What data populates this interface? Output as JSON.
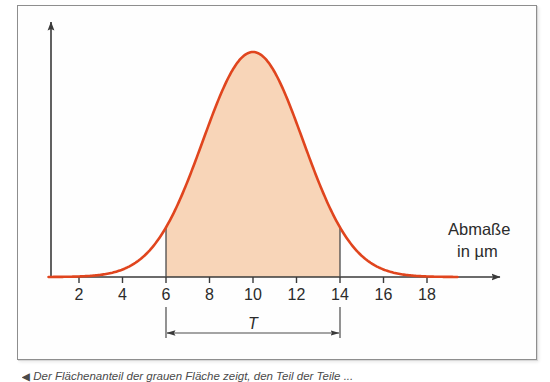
{
  "figure": {
    "type": "gauss-distribution-curve",
    "axis_label_lines": [
      "Abmaße",
      "in µm"
    ],
    "tolerance_label": "T",
    "caption_marker": "◀",
    "caption_text": "Der Flächenanteil der grauen Fläche zeigt, den Teil der Teile ...",
    "colors": {
      "curve_stroke": "#e0451e",
      "curve_fill": "#f8d5b8",
      "axis": "#3a3a3a",
      "frame_border": "#8e8e8e",
      "text": "#2b2b2b"
    }
  },
  "chart_data": {
    "type": "area",
    "title": "",
    "xlabel": "Abmaße in µm",
    "ylabel": "",
    "xlim": [
      0,
      19.6
    ],
    "ylim": [
      0,
      1.12
    ],
    "grid": false,
    "legend": null,
    "tick_labels": [
      "2",
      "4",
      "6",
      "8",
      "10",
      "12",
      "14",
      "16",
      "18"
    ],
    "tick_values": [
      2,
      4,
      6,
      8,
      10,
      12,
      14,
      16,
      18
    ],
    "distribution": {
      "kind": "normal",
      "mean": 10,
      "sigma": 2.3,
      "peak_value": 1.0
    },
    "x": [
      0.5,
      1,
      2,
      3,
      4,
      5,
      6,
      7,
      8,
      9,
      10,
      11,
      12,
      13,
      14,
      15,
      16,
      17,
      18,
      19
    ],
    "y": [
      0.0,
      0.0,
      0.002,
      0.012,
      0.047,
      0.135,
      0.3,
      0.53,
      0.78,
      0.955,
      1.0,
      0.955,
      0.78,
      0.53,
      0.3,
      0.135,
      0.047,
      0.012,
      0.002,
      0.0
    ],
    "shaded_region": {
      "label": "T",
      "from": 6,
      "to": 14,
      "fill": "#f8d5b8"
    },
    "annotations": [
      {
        "name": "tolerance-dimension",
        "label": "T",
        "from": 6,
        "to": 14
      }
    ]
  }
}
